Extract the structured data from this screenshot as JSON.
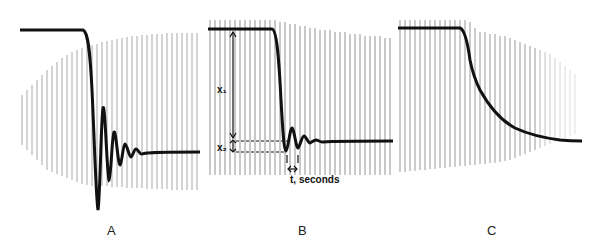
{
  "figure": {
    "panels": [
      {
        "id": "A",
        "label": "A",
        "response": "underdamped-oscillating"
      },
      {
        "id": "B",
        "label": "B",
        "response": "lightly-underdamped-annotated"
      },
      {
        "id": "C",
        "label": "C",
        "response": "overdamped-exponential"
      }
    ],
    "annotations": {
      "x1": "x₁",
      "x2": "x₂",
      "time": "t, seconds"
    },
    "colors": {
      "trace": "#111111",
      "grid": "#555555",
      "background": "#ffffff"
    }
  }
}
